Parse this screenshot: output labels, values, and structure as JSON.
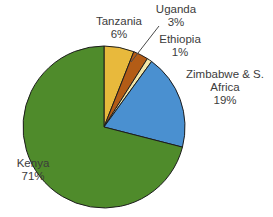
{
  "chart_data": {
    "type": "pie",
    "title": "",
    "subtitle": "",
    "xlabel": "",
    "ylabel": "",
    "legend_position": "none",
    "grid": false,
    "labels_on_slices": false,
    "categories": [
      "Tanzania",
      "Uganda",
      "Ethiopia",
      "Zimbabwe & S. Africa",
      "Kenya"
    ],
    "values": [
      6,
      3,
      1,
      19,
      71
    ],
    "value_unit": "%",
    "start_angle_deg": 0,
    "direction": "clockwise",
    "slices": [
      {
        "label": "Tanzania",
        "value": 6,
        "value_text": "6%",
        "color": "#E8B93C",
        "has_leader_line": false
      },
      {
        "label": "Uganda",
        "value": 3,
        "value_text": "3%",
        "color": "#B35C16",
        "has_leader_line": true
      },
      {
        "label": "Ethiopia",
        "value": 1,
        "value_text": "1%",
        "color": "#F2E6A8",
        "has_leader_line": false
      },
      {
        "label": "Zimbabwe & S. Africa",
        "value": 19,
        "value_text": "19%",
        "color": "#4A90D0",
        "has_leader_line": false
      },
      {
        "label": "Kenya",
        "value": 71,
        "value_text": "71%",
        "color": "#4F8B2B",
        "has_leader_line": false
      }
    ]
  },
  "labels": {
    "tanzania": {
      "name": "Tanzania",
      "pct": "6%"
    },
    "uganda": {
      "name": "Uganda",
      "pct": "3%"
    },
    "ethiopia": {
      "name": "Ethiopia",
      "pct": "1%"
    },
    "zimbabwe": {
      "name": "Zimbabwe & S.",
      "name2": "Africa",
      "pct": "19%"
    },
    "kenya": {
      "name": "Kenya",
      "pct": "71%"
    }
  },
  "colors": {
    "background": "#ffffff",
    "outline": "#1d1d1d",
    "text": "#3c3c3c",
    "kenya": "#4F8B2B",
    "tanzania": "#E8B93C",
    "uganda": "#B35C16",
    "ethiopia": "#F2E6A8",
    "zimbabwe": "#4A90D0"
  }
}
